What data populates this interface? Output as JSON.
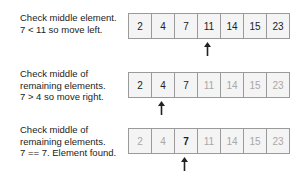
{
  "steps": [
    {
      "caption_lines": [
        "Check middle element.",
        "7 < 11 so move left."
      ],
      "cells": [
        {
          "value": "2",
          "state": "active"
        },
        {
          "value": "4",
          "state": "active"
        },
        {
          "value": "7",
          "state": "active"
        },
        {
          "value": "11",
          "state": "active"
        },
        {
          "value": "14",
          "state": "active"
        },
        {
          "value": "15",
          "state": "active"
        },
        {
          "value": "23",
          "state": "active"
        }
      ],
      "pointer_index": 3
    },
    {
      "caption_lines": [
        "Check middle of",
        "remaining elements.",
        "7 > 4 so move right."
      ],
      "cells": [
        {
          "value": "2",
          "state": "active"
        },
        {
          "value": "4",
          "state": "active"
        },
        {
          "value": "7",
          "state": "active"
        },
        {
          "value": "11",
          "state": "dim"
        },
        {
          "value": "14",
          "state": "dim"
        },
        {
          "value": "15",
          "state": "dim"
        },
        {
          "value": "23",
          "state": "dim"
        }
      ],
      "pointer_index": 1
    },
    {
      "caption_lines": [
        "Check middle of",
        "remaining elements.",
        "7 == 7. Element found."
      ],
      "cells": [
        {
          "value": "2",
          "state": "dim"
        },
        {
          "value": "4",
          "state": "dim"
        },
        {
          "value": "7",
          "state": "found"
        },
        {
          "value": "11",
          "state": "dim"
        },
        {
          "value": "14",
          "state": "dim"
        },
        {
          "value": "15",
          "state": "dim"
        },
        {
          "value": "23",
          "state": "dim"
        }
      ],
      "pointer_index": 2
    }
  ],
  "colors": {
    "border": "#9a9a9a",
    "cell_bg": "#f4f4f4",
    "text": "#222222",
    "dim_text": "#a8a8a8"
  }
}
